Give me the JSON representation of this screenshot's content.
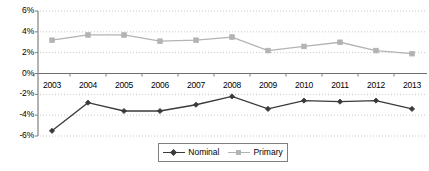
{
  "chart_data": {
    "type": "line",
    "title": "",
    "xlabel": "",
    "ylabel": "",
    "categories": [
      "2003",
      "2004",
      "2005",
      "2006",
      "2007",
      "2008",
      "2009",
      "2010",
      "2011",
      "2012",
      "2013"
    ],
    "series": [
      {
        "name": "Nominal",
        "color": "#3a3a3a",
        "marker": "diamond",
        "values": [
          -5.5,
          -2.8,
          -3.6,
          -3.6,
          -3.0,
          -2.2,
          -3.4,
          -2.6,
          -2.7,
          -2.6,
          -3.4
        ]
      },
      {
        "name": "Primary",
        "color": "#b3b3b3",
        "marker": "square",
        "values": [
          3.2,
          3.7,
          3.7,
          3.1,
          3.2,
          3.5,
          2.2,
          2.6,
          3.0,
          2.2,
          1.9
        ]
      }
    ],
    "ylim": [
      -6,
      6
    ],
    "yticks": [
      6,
      4,
      2,
      0,
      -2,
      -4,
      -6
    ],
    "ytick_labels": [
      "6%",
      "4%",
      "2%",
      "0%",
      "-2%",
      "-4%",
      "-6%"
    ],
    "grid": true,
    "grid_style": "dotted",
    "grid_color": "#c8c8c8",
    "axis_color": "#808080",
    "legend_position": "bottom-center",
    "legend_entries": [
      "Nominal",
      "Primary"
    ]
  }
}
